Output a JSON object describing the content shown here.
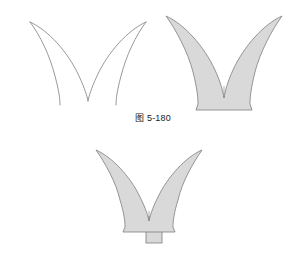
{
  "page": {
    "background_color": "#ffffff",
    "width": 306,
    "height": 274
  },
  "style": {
    "fill_color": "#d9d9d9",
    "stroke_color": "#7d7d7d",
    "caption_color": "#1a1a1a"
  },
  "figures": [
    {
      "id": "figure-180",
      "caption": "图 5-180",
      "shapes": [
        {
          "name": "petal-pair-outline",
          "label": "outline-only double-petal V form",
          "filled": false
        },
        {
          "name": "petal-pair-filled",
          "label": "shaded double-petal V form with flared base",
          "filled": true
        }
      ]
    },
    {
      "id": "figure-181",
      "caption": "图 5-181",
      "shapes": [
        {
          "name": "petal-pair-filled-stem",
          "label": "shaded double-petal V form with flared base and stem",
          "filled": true
        }
      ]
    }
  ]
}
